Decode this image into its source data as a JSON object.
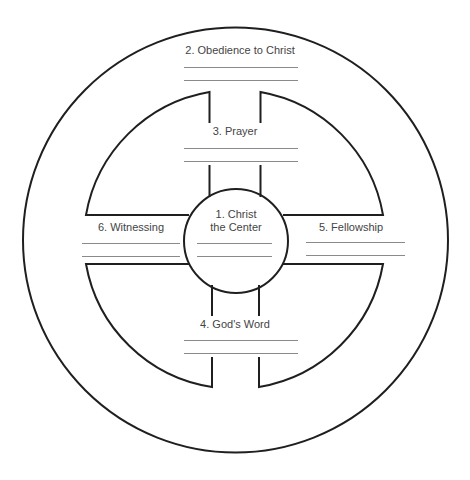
{
  "diagram": {
    "colors": {
      "stroke": "#1f1f1f",
      "blank_line": "#8a8a8a",
      "text": "#444444",
      "background": "#ffffff"
    },
    "sections": [
      {
        "number": "1.",
        "label_line1": "1.  Christ",
        "label_line2": "the Center",
        "position": "center"
      },
      {
        "number": "2.",
        "label": "2.  Obedience to Christ",
        "position": "outer-rim"
      },
      {
        "number": "3.",
        "label": "3.  Prayer",
        "position": "top-spoke"
      },
      {
        "number": "4.",
        "label": "4.  God's Word",
        "position": "bottom-spoke"
      },
      {
        "number": "5.",
        "label": "5.  Fellowship",
        "position": "right-spoke"
      },
      {
        "number": "6.",
        "label": "6.  Witnessing",
        "position": "left-spoke"
      }
    ],
    "blank_lines_per_section": 2
  }
}
